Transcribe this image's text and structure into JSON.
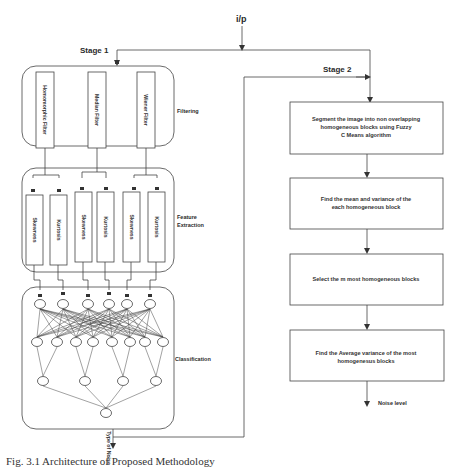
{
  "input_label": "i/p",
  "stage1": {
    "label": "Stage 1",
    "filtering": {
      "label": "Filtering",
      "filters": [
        "Homomorphic Filter",
        "Median Filter",
        "Wiener Filter"
      ]
    },
    "feature_extraction": {
      "label_line1": "Feature",
      "label_line2": "Extraction",
      "features": [
        "Skewness",
        "Kurtosis",
        "Skewness",
        "Kurtosis",
        "Skewness",
        "Kurtosis"
      ]
    },
    "classification": {
      "label": "Classification",
      "layers": [
        6,
        8,
        4,
        1
      ]
    },
    "output_label": "Type of Noise"
  },
  "stage2": {
    "label": "Stage 2",
    "steps": [
      [
        "Segment the image into  non overlapping",
        "homogeneous blocks using Fuzzy",
        "C Means algorithm"
      ],
      [
        "Find the mean and variance of the",
        "each homogeneous block"
      ],
      [
        "Select the m most homogeneous blocks"
      ],
      [
        "Find the Average variance of the most",
        "homogenesus blocks"
      ]
    ],
    "output_label": "Noise level"
  },
  "caption": "Fig. 3.1  Architecture of Proposed Methodology"
}
